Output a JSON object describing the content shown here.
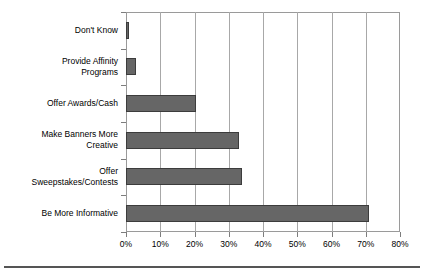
{
  "chart_data": {
    "type": "bar",
    "orientation": "horizontal",
    "title": "",
    "subtitle": "",
    "xlabel": "",
    "ylabel": "",
    "categories": [
      "Don't Know",
      "Provide Affinity\nPrograms",
      "Offer Awards/Cash",
      "Make Banners More\nCreative",
      "Offer\nSweepstakes/Contests",
      "Be More Informative"
    ],
    "values": [
      1,
      3,
      20.5,
      33,
      34,
      71
    ],
    "value_unit": "%",
    "xlim": [
      0,
      80
    ],
    "xticks": [
      0,
      10,
      20,
      30,
      40,
      50,
      60,
      70,
      80
    ],
    "xtick_labels": [
      "0%",
      "10%",
      "20%",
      "30%",
      "40%",
      "50%",
      "60%",
      "70%",
      "80%"
    ],
    "grid": {
      "vertical": true,
      "horizontal": false
    },
    "legend": {
      "visible": false,
      "position": "none"
    },
    "colors": {
      "bar_fill": "#666666",
      "bar_edge": "#3c3c3c",
      "gridline": "#a8a8a8",
      "axis": "#9a9a9a",
      "text": "#000000",
      "background": "#ffffff",
      "rule": "#555555"
    }
  }
}
